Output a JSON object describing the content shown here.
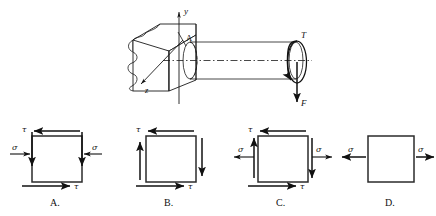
{
  "figure": {
    "background_color": "#ffffff",
    "line_color": "#1a1a1a",
    "width": 436,
    "height": 216
  },
  "shaft_diagram": {
    "name": "cantilever-shaft-diagram",
    "axes": {
      "y_label": "y",
      "z_label": "z"
    },
    "point_label": "A",
    "torque_label": "T",
    "force_label": "F",
    "description": "Circular shaft fixed in a wall, loaded by torque T and downward force F at the free end"
  },
  "options": [
    {
      "id": "A",
      "label": "A.",
      "name": "option-a",
      "normal_stress_label": "σ",
      "shear_stress_label": "τ",
      "normal_stress_sense": "compression",
      "has_normal_stress": true,
      "has_shear_stress": true,
      "shear_top_direction": "left",
      "shear_bottom_direction": "right",
      "shear_left_direction": "down",
      "shear_right_direction": "down",
      "tau_labels": [
        "τ",
        "τ"
      ],
      "sigma_labels": [
        "σ",
        "σ"
      ]
    },
    {
      "id": "B",
      "label": "B.",
      "name": "option-b",
      "normal_stress_label": "",
      "shear_stress_label": "τ",
      "normal_stress_sense": "none",
      "has_normal_stress": false,
      "has_shear_stress": true,
      "shear_top_direction": "left",
      "shear_bottom_direction": "right",
      "shear_left_direction": "up",
      "shear_right_direction": "down",
      "tau_labels": [
        "τ",
        "τ"
      ],
      "sigma_labels": []
    },
    {
      "id": "C",
      "label": "C.",
      "name": "option-c",
      "normal_stress_label": "σ",
      "shear_stress_label": "τ",
      "normal_stress_sense": "tension",
      "has_normal_stress": true,
      "has_shear_stress": true,
      "shear_top_direction": "left",
      "shear_bottom_direction": "right",
      "shear_left_direction": "up",
      "shear_right_direction": "down",
      "tau_labels": [
        "τ",
        "τ"
      ],
      "sigma_labels": [
        "σ",
        "σ"
      ]
    },
    {
      "id": "D",
      "label": "D.",
      "name": "option-d",
      "normal_stress_label": "σ",
      "shear_stress_label": "",
      "normal_stress_sense": "tension",
      "has_normal_stress": true,
      "has_shear_stress": false,
      "shear_top_direction": "none",
      "shear_bottom_direction": "none",
      "shear_left_direction": "none",
      "shear_right_direction": "none",
      "tau_labels": [],
      "sigma_labels": [
        "σ",
        "σ"
      ]
    }
  ]
}
